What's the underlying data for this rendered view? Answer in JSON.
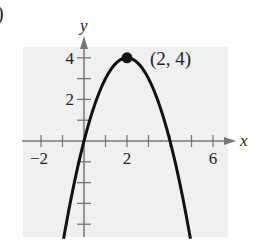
{
  "part_label": ")",
  "chart_data": {
    "type": "line",
    "title": "",
    "xlabel": "x",
    "ylabel": "y",
    "xlim": [
      -2.8,
      6.8
    ],
    "ylim": [
      -4.5,
      4.5
    ],
    "x_ticks": [
      -2,
      -1,
      1,
      2,
      3,
      4,
      5,
      6
    ],
    "y_ticks": [
      -4,
      -3,
      -2,
      -1,
      1,
      2,
      3,
      4
    ],
    "x_tick_labels": [
      {
        "value": -2,
        "label": "−2"
      },
      {
        "value": 2,
        "label": "2"
      },
      {
        "value": 6,
        "label": "6"
      }
    ],
    "y_tick_labels": [
      {
        "value": 2,
        "label": "2"
      },
      {
        "value": 4,
        "label": "4"
      }
    ],
    "grid": false,
    "background": "#f0f0f0",
    "curve_color": "#111111",
    "axis_color": "#777777",
    "series": [
      {
        "name": "parabola",
        "equation": "y = -(x - 2)^2 + 4",
        "vertex": [
          2,
          4
        ],
        "a": -1,
        "x_range": [
          -0.95,
          4.95
        ]
      }
    ],
    "points": [
      {
        "x": 2,
        "y": 4,
        "label": "(2, 4)"
      }
    ]
  }
}
